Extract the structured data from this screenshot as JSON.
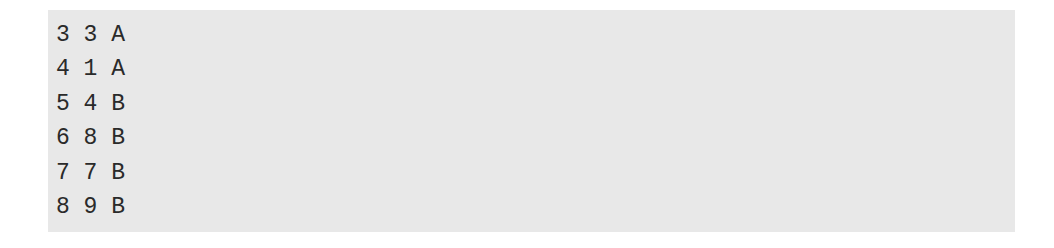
{
  "code_block": {
    "background": "#e8e8e8",
    "lines": [
      "3 3 A",
      "4 1 A",
      "5 4 B",
      "6 8 B",
      "7 7 B",
      "8 9 B"
    ]
  }
}
